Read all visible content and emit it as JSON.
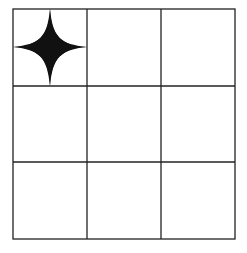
{
  "diagram": {
    "type": "grid",
    "rows": 3,
    "cols": 3,
    "line_color": "#222222",
    "fill_color": "#111111",
    "background": "#ffffff",
    "shapes": [
      {
        "kind": "astroid-star",
        "row": 0,
        "col": 0,
        "label": "four-pointed concave star"
      }
    ]
  }
}
